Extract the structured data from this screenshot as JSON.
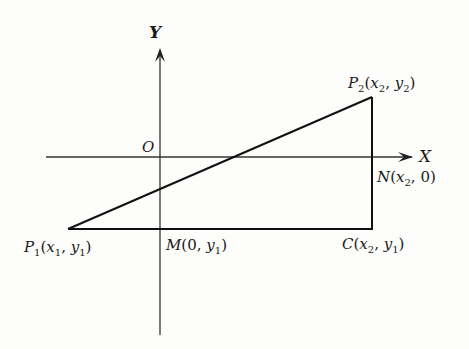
{
  "diagram": {
    "axes": {
      "x_label": "X",
      "y_label": "Y",
      "origin_label": "O"
    },
    "points": {
      "P1": {
        "name": "P",
        "sub": "1",
        "coords": "(x1, y1)",
        "x_var": "x",
        "x_sub": "1",
        "y_var": "y",
        "y_sub": "1"
      },
      "P2": {
        "name": "P",
        "sub": "2",
        "coords": "(x2, y2)",
        "x_var": "x",
        "x_sub": "2",
        "y_var": "y",
        "y_sub": "2"
      },
      "M": {
        "name": "M",
        "coords": "(0, y1)",
        "x_val": "0",
        "y_var": "y",
        "y_sub": "1"
      },
      "N": {
        "name": "N",
        "coords": "(x2, 0)",
        "x_var": "x",
        "x_sub": "2",
        "y_val": "0"
      },
      "C": {
        "name": "C",
        "coords": "(x2, y1)",
        "x_var": "x",
        "x_sub": "2",
        "y_var": "y",
        "y_sub": "1"
      }
    },
    "punct": {
      "open": "(",
      "close": ")",
      "comma": ", "
    },
    "colors": {
      "line": "#1a1a1a",
      "background": "#fdfdfb"
    }
  }
}
